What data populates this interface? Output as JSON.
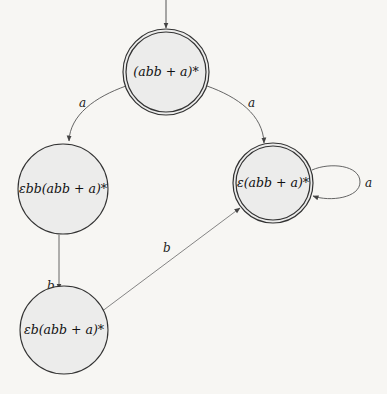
{
  "diagram": {
    "type": "finite-automaton",
    "colors": {
      "background": "#f7f6f3",
      "node_fill": "#ececeb",
      "stroke": "#333333",
      "edge": "#555555"
    },
    "nodes": [
      {
        "id": "n0",
        "label": "(abb + a)*",
        "initial": true,
        "accepting": true
      },
      {
        "id": "n1",
        "label": "εbb(abb + a)*",
        "initial": false,
        "accepting": false
      },
      {
        "id": "n2",
        "label": "ε(abb + a)*",
        "initial": false,
        "accepting": true
      },
      {
        "id": "n3",
        "label": "εb(abb + a)*",
        "initial": false,
        "accepting": false
      }
    ],
    "edges": [
      {
        "from": "n0",
        "to": "n1",
        "label": "a"
      },
      {
        "from": "n0",
        "to": "n2",
        "label": "a"
      },
      {
        "from": "n1",
        "to": "n3",
        "label": "b"
      },
      {
        "from": "n3",
        "to": "n2",
        "label": "b"
      },
      {
        "from": "n2",
        "to": "n2",
        "label": "a"
      }
    ]
  }
}
